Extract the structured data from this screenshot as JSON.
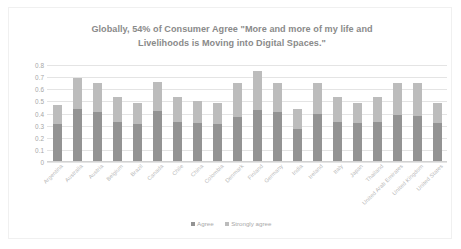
{
  "chart_data": {
    "type": "bar",
    "subtype": "stacked",
    "title": "Globally, 54% of Consumer Agree \"More and more of my life and Livelihoods is Moving into Digital Spaces.\"",
    "title_line1": "Globally, 54% of Consumer Agree \"More and more of my life and",
    "title_line2": "Livelihoods is Moving into Digital Spaces.\"",
    "xlabel": "",
    "ylabel": "",
    "ylim": [
      0,
      0.8
    ],
    "ytick_labels": [
      "0.8",
      "0.7",
      "0.6",
      "0.5",
      "0.4",
      "0.3",
      "0.2",
      "0.1",
      "0"
    ],
    "ytick_values": [
      0.8,
      0.7,
      0.6,
      0.5,
      0.4,
      0.3,
      0.2,
      0.1,
      0
    ],
    "grid": true,
    "legend_position": "bottom",
    "categories": [
      "Argentina",
      "Australia",
      "Austria",
      "Belgium",
      "Brazil",
      "Canada",
      "Chile",
      "China",
      "Colombia",
      "Denmark",
      "Finland",
      "Germany",
      "India",
      "Ireland",
      "Italy",
      "Japan",
      "Thailand",
      "United Arab Emirates",
      "United Kingdom",
      "United States"
    ],
    "series": [
      {
        "name": "Agree",
        "color": "#939393",
        "values": [
          0.31,
          0.44,
          0.41,
          0.33,
          0.31,
          0.42,
          0.33,
          0.32,
          0.31,
          0.37,
          0.43,
          0.41,
          0.27,
          0.4,
          0.33,
          0.32,
          0.33,
          0.39,
          0.38,
          0.32
        ]
      },
      {
        "name": "Strongly agree",
        "color": "#bcbcbc",
        "values": [
          0.16,
          0.25,
          0.24,
          0.21,
          0.18,
          0.24,
          0.21,
          0.18,
          0.18,
          0.28,
          0.32,
          0.24,
          0.17,
          0.25,
          0.21,
          0.17,
          0.21,
          0.26,
          0.27,
          0.17
        ]
      }
    ],
    "totals": [
      0.47,
      0.69,
      0.65,
      0.54,
      0.49,
      0.66,
      0.54,
      0.5,
      0.49,
      0.65,
      0.75,
      0.65,
      0.44,
      0.65,
      0.54,
      0.49,
      0.54,
      0.65,
      0.65,
      0.49
    ]
  },
  "legend": {
    "items": [
      {
        "label": "Agree",
        "color": "#939393"
      },
      {
        "label": "Strongly agree",
        "color": "#bcbcbc"
      }
    ]
  },
  "colors": {
    "title": "#8a8a8a",
    "axis_text": "#a6a6a6",
    "gridline": "#e4e4e4",
    "agree": "#939393",
    "strongly_agree": "#bcbcbc",
    "background": "#ffffff"
  }
}
